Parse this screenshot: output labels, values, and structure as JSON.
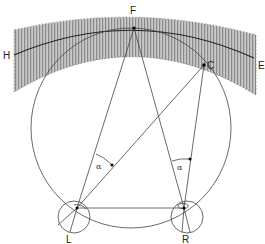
{
  "diagram": {
    "labels": {
      "F": "F",
      "H": "H",
      "E": "E",
      "C": "C",
      "L": "L",
      "R": "R",
      "alpha_left": "α",
      "alpha_right": "α"
    },
    "colors": {
      "line": "#333333",
      "band_fill": "#b8b8b8",
      "band_stripe": "#8a8a8a",
      "horopter": "#222222"
    }
  }
}
